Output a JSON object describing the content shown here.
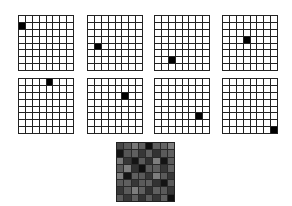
{
  "figure": {
    "grid_size": 8,
    "one_hot_grids": [
      {
        "row": 1,
        "col": 0
      },
      {
        "row": 4,
        "col": 1
      },
      {
        "row": 6,
        "col": 2
      },
      {
        "row": 3,
        "col": 3
      },
      {
        "row": 0,
        "col": 4
      },
      {
        "row": 2,
        "col": 5
      },
      {
        "row": 5,
        "col": 6
      },
      {
        "row": 7,
        "col": 7
      }
    ],
    "combined_grid_gray_levels": [
      [
        70,
        90,
        120,
        95,
        15,
        95,
        100,
        125
      ],
      [
        20,
        85,
        95,
        55,
        95,
        50,
        90,
        95
      ],
      [
        120,
        55,
        20,
        90,
        50,
        125,
        20,
        90
      ],
      [
        90,
        125,
        50,
        15,
        90,
        95,
        55,
        95
      ],
      [
        125,
        20,
        95,
        90,
        55,
        125,
        90,
        55
      ],
      [
        90,
        95,
        55,
        90,
        95,
        50,
        20,
        90
      ],
      [
        55,
        90,
        125,
        95,
        50,
        95,
        90,
        55
      ],
      [
        90,
        55,
        95,
        50,
        90,
        55,
        95,
        15
      ]
    ],
    "colors": {
      "on_cell": "#000000",
      "off_cell": "#ffffff",
      "grid_line": "#222222"
    }
  }
}
